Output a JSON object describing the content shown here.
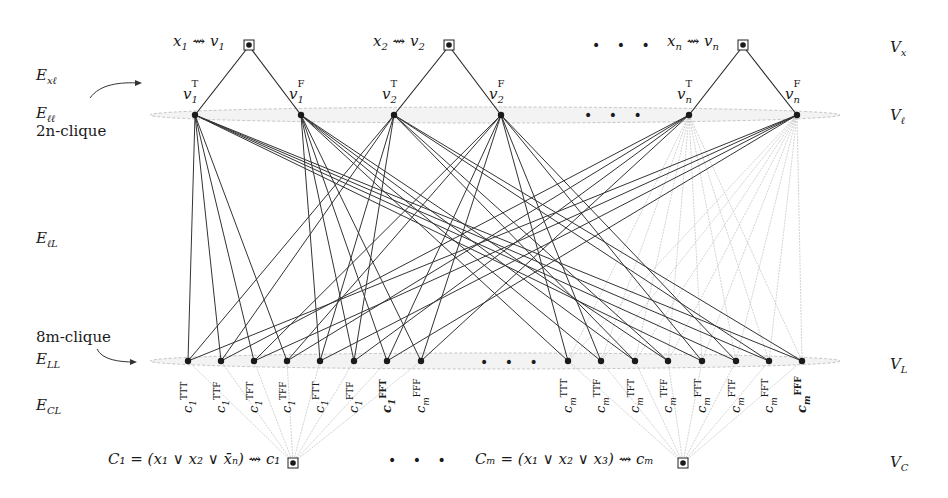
{
  "diagram": {
    "row_labels_left": {
      "e_xl": "E",
      "e_xl_sub": "xℓ",
      "e_ll": "E",
      "e_ll_sub": "ℓℓ",
      "clique_top": "2n-clique",
      "e_lL": "E",
      "e_lL_sub": "ℓL",
      "clique_bottom": "8m-clique",
      "e_LL": "E",
      "e_LL_sub": "LL",
      "e_CL": "E",
      "e_CL_sub": "CL"
    },
    "row_labels_right": {
      "v_x": "V",
      "v_x_sub": "x",
      "v_l": "V",
      "v_l_sub": "ℓ",
      "v_L": "V",
      "v_L_sub": "L",
      "v_C": "V",
      "v_C_sub": "C"
    },
    "variables": [
      {
        "label": "x",
        "idx": "1",
        "target": "v",
        "x": 249
      },
      {
        "label": "x",
        "idx": "2",
        "target": "v",
        "x": 449
      },
      {
        "label": "x",
        "idx": "n",
        "target": "v",
        "x": 743
      }
    ],
    "variable_ellipsis": "• • •",
    "literals": [
      {
        "name": "v",
        "idx": "1",
        "sup": "T",
        "x": 195
      },
      {
        "name": "v",
        "idx": "1",
        "sup": "F",
        "x": 301
      },
      {
        "name": "v",
        "idx": "2",
        "sup": "T",
        "x": 394
      },
      {
        "name": "v",
        "idx": "2",
        "sup": "F",
        "x": 501
      },
      {
        "name": "v",
        "idx": "n",
        "sup": "T",
        "x": 689
      },
      {
        "name": "v",
        "idx": "n",
        "sup": "F",
        "x": 797
      }
    ],
    "literal_ellipsis": "• • •",
    "assignment_nodes_left": [
      {
        "sup": "TTT",
        "sub": "1",
        "bold": false,
        "x": 188
      },
      {
        "sup": "TTF",
        "sub": "1",
        "bold": false,
        "x": 221
      },
      {
        "sup": "TFT",
        "sub": "1",
        "bold": false,
        "x": 254
      },
      {
        "sup": "TFF",
        "sub": "1",
        "bold": false,
        "x": 287
      },
      {
        "sup": "FTT",
        "sub": "1",
        "bold": false,
        "x": 320
      },
      {
        "sup": "FTF",
        "sub": "1",
        "bold": false,
        "x": 354
      },
      {
        "sup": "FFT",
        "sub": "1",
        "bold": true,
        "x": 387
      },
      {
        "sup": "FFF",
        "sub": "m",
        "bold": false,
        "x": 421
      }
    ],
    "assignment_nodes_right": [
      {
        "sup": "TTT",
        "sub": "m",
        "bold": false,
        "x": 568
      },
      {
        "sup": "TTF",
        "sub": "m",
        "bold": false,
        "x": 601
      },
      {
        "sup": "TFT",
        "sub": "m",
        "bold": false,
        "x": 635
      },
      {
        "sup": "TFF",
        "sub": "m",
        "bold": false,
        "x": 668
      },
      {
        "sup": "FTT",
        "sub": "m",
        "bold": false,
        "x": 702
      },
      {
        "sup": "FTF",
        "sub": "m",
        "bold": false,
        "x": 736
      },
      {
        "sup": "FFT",
        "sub": "m",
        "bold": false,
        "x": 769
      },
      {
        "sup": "FFF",
        "sub": "m",
        "bold": true,
        "x": 802
      }
    ],
    "assignment_ellipsis": "• • •",
    "clauses": [
      {
        "text": "C₁ = (x₁ ∨ x₂ ∨ x̄ₙ) ⇝ c₁",
        "x": 293
      },
      {
        "text": "Cₘ = (x₁ ∨ x₂ ∨ x₃) ⇝ cₘ",
        "x": 683
      }
    ],
    "clause_ellipsis": "• • •",
    "colors": {
      "edge_dark": "#333333",
      "edge_light": "#c8c8c8",
      "node": "#1a1a1a",
      "clique_ellipse": "#bdbdbd"
    },
    "dark_edges": [
      [
        0,
        0
      ],
      [
        0,
        1
      ],
      [
        0,
        2
      ],
      [
        0,
        3
      ],
      [
        0,
        12
      ],
      [
        0,
        13
      ],
      [
        0,
        14
      ],
      [
        0,
        15
      ],
      [
        1,
        4
      ],
      [
        1,
        5
      ],
      [
        1,
        6
      ],
      [
        1,
        7
      ],
      [
        1,
        8
      ],
      [
        1,
        9
      ],
      [
        1,
        10
      ],
      [
        1,
        11
      ],
      [
        2,
        0
      ],
      [
        2,
        1
      ],
      [
        2,
        4
      ],
      [
        2,
        5
      ],
      [
        2,
        10
      ],
      [
        2,
        11
      ],
      [
        2,
        14
      ],
      [
        2,
        15
      ],
      [
        3,
        2
      ],
      [
        3,
        3
      ],
      [
        3,
        6
      ],
      [
        3,
        7
      ],
      [
        3,
        8
      ],
      [
        3,
        9
      ],
      [
        3,
        12
      ],
      [
        3,
        13
      ],
      [
        4,
        1
      ],
      [
        4,
        3
      ],
      [
        4,
        5
      ],
      [
        4,
        7
      ],
      [
        5,
        0
      ],
      [
        5,
        2
      ],
      [
        5,
        4
      ],
      [
        5,
        6
      ]
    ],
    "light_edges_literal": [
      [
        4,
        9
      ],
      [
        4,
        11
      ],
      [
        4,
        13
      ],
      [
        4,
        15
      ],
      [
        4,
        8
      ],
      [
        4,
        10
      ],
      [
        4,
        12
      ],
      [
        4,
        14
      ],
      [
        5,
        8
      ],
      [
        5,
        10
      ],
      [
        5,
        12
      ],
      [
        5,
        14
      ],
      [
        5,
        9
      ],
      [
        5,
        11
      ],
      [
        5,
        13
      ],
      [
        5,
        15
      ]
    ]
  }
}
